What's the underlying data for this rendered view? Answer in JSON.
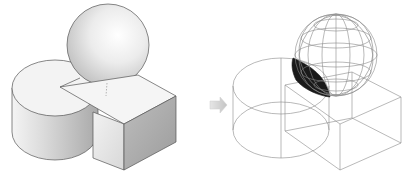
{
  "figure": {
    "left_panel": {
      "label": "shaded-solid-model",
      "objects": [
        "cylinder",
        "box",
        "sphere"
      ]
    },
    "arrow": {
      "direction": "right",
      "color": "#c8c8c8"
    },
    "right_panel": {
      "label": "wireframe-model",
      "objects": [
        "cylinder-wireframe",
        "box-wireframe",
        "sphere-wireframe",
        "highlighted-intersection-region"
      ],
      "highlight_color": "#1a1a1a"
    },
    "colors": {
      "background": "#ffffff",
      "edge": "#555555",
      "wire": "#8a8a8a",
      "shade_light": "#f2f2f2",
      "shade_mid": "#d6d6d6",
      "shade_dark": "#a8a8a8"
    }
  }
}
